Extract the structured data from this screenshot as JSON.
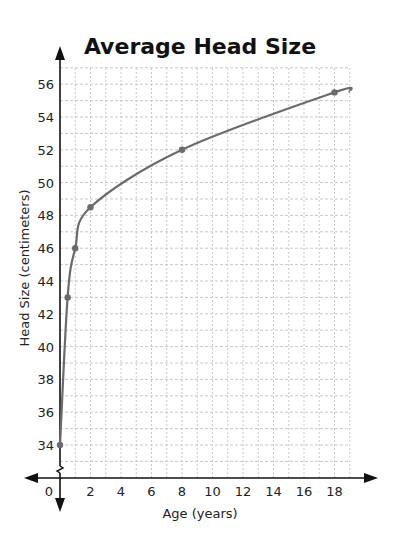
{
  "chart_data": {
    "type": "line",
    "title": "Average Head Size",
    "xlabel": "Age (years)",
    "ylabel": "Head Size (centimeters)",
    "x_ticks": [
      0,
      2,
      4,
      6,
      8,
      10,
      12,
      14,
      16,
      18
    ],
    "y_ticks": [
      34,
      36,
      38,
      40,
      42,
      44,
      46,
      48,
      50,
      52,
      54,
      56
    ],
    "xlim": [
      0,
      19
    ],
    "ylim": [
      33,
      57
    ],
    "y_axis_break": true,
    "grid": true,
    "legend": null,
    "series": [
      {
        "name": "Average Head Size",
        "x": [
          0,
          0.5,
          1,
          2,
          8,
          18
        ],
        "y": [
          34,
          43,
          46,
          48.5,
          52,
          55.5
        ],
        "marked_points": true
      }
    ],
    "colors": {
      "line": "#6b6b6b",
      "point": "#6b6b6b",
      "grid": "#c8c8c8",
      "axis": "#111111"
    }
  }
}
